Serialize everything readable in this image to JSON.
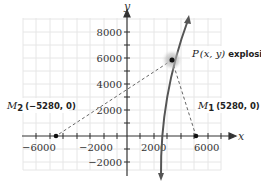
{
  "diagram": {
    "axes": {
      "x_label": "x",
      "y_label": "y",
      "x_ticks": [
        {
          "value": -6000,
          "label": "−6000"
        },
        {
          "value": -2000,
          "label": "−2000"
        },
        {
          "value": 2000,
          "label": "2000"
        },
        {
          "value": 6000,
          "label": "6000"
        }
      ],
      "y_ticks": [
        {
          "value": 8000,
          "label": "8000"
        },
        {
          "value": 6000,
          "label": "6000"
        },
        {
          "value": 4000,
          "label": "4000"
        },
        {
          "value": 2000,
          "label": "2000"
        },
        {
          "value": -2000,
          "label": "−2000"
        }
      ]
    },
    "points": {
      "p": {
        "name": "P",
        "coords": "(x, y)",
        "note": "explosion"
      },
      "m1": {
        "name": "M",
        "sub": "1",
        "coords": "(5280, 0)"
      },
      "m2": {
        "name": "M",
        "sub": "2",
        "coords": "(−5280, 0)"
      }
    }
  }
}
